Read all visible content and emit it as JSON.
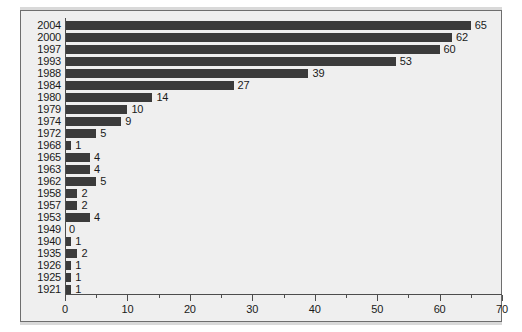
{
  "chart_data": {
    "type": "bar",
    "orientation": "horizontal",
    "title": "",
    "subtitle": "",
    "xlabel": "",
    "ylabel": "",
    "xlim": [
      0,
      70
    ],
    "ylim": null,
    "grid": false,
    "legend": null,
    "legend_position": "none",
    "x_ticks_major": [
      0,
      10,
      20,
      30,
      40,
      50,
      60,
      70
    ],
    "x_tick_labels": [
      "0",
      "10",
      "20",
      "30",
      "40",
      "50",
      "60",
      "70"
    ],
    "x_ticks_minor": [
      5,
      15,
      25,
      35,
      45,
      55,
      65
    ],
    "categories": [
      "2004",
      "2000",
      "1997",
      "1993",
      "1988",
      "1984",
      "1980",
      "1979",
      "1974",
      "1972",
      "1968",
      "1965",
      "1963",
      "1962",
      "1958",
      "1957",
      "1953",
      "1949",
      "1940",
      "1935",
      "1926",
      "1925",
      "1921"
    ],
    "values": [
      65,
      62,
      60,
      53,
      39,
      27,
      14,
      10,
      9,
      5,
      1,
      4,
      4,
      5,
      2,
      2,
      4,
      0,
      1,
      2,
      1,
      1,
      1
    ],
    "value_labels": [
      "65",
      "62",
      "60",
      "53",
      "39",
      "27",
      "14",
      "10",
      "9",
      "5",
      "1",
      "4",
      "4",
      "5",
      "2",
      "2",
      "4",
      "0",
      "1",
      "2",
      "1",
      "1",
      "1"
    ],
    "colors": {
      "bar": "#3b3b3b",
      "plot_background": "#efefef",
      "figure_background": "#d9d9d9",
      "axis": "#4d4d4d",
      "text": "#1a1a1a",
      "frame_border": "#6e6e6e"
    }
  }
}
